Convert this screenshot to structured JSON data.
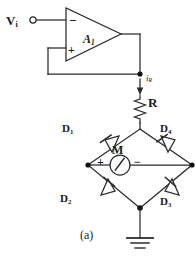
{
  "figure": {
    "caption": "(a)"
  },
  "labels": {
    "input_source": "V",
    "input_source_sub": "i",
    "opamp": "A",
    "opamp_sub": "1",
    "inverting_input": "−",
    "noninverting_input": "+",
    "resistor_current": "i",
    "resistor_current_sub": "R",
    "resistor": "R",
    "diode_1": "D",
    "diode_1_sub": "1",
    "diode_2": "D",
    "diode_2_sub": "2",
    "diode_3": "D",
    "diode_3_sub": "3",
    "diode_4": "D",
    "diode_4_sub": "4",
    "meter": "M",
    "meter_plus": "+",
    "meter_minus": "−"
  },
  "colors": {
    "wire": "#2b2b2b",
    "text": "#1a1a1a",
    "background": "#ffffff",
    "node": "#111111"
  },
  "components": [
    {
      "name": "input-terminal",
      "type": "terminal",
      "label": "Vi"
    },
    {
      "name": "opamp",
      "type": "operational-amplifier",
      "label": "A1"
    },
    {
      "name": "feedback-wire",
      "type": "wire"
    },
    {
      "name": "resistor",
      "type": "resistor",
      "label": "R"
    },
    {
      "name": "current-arrow",
      "type": "current-direction",
      "label": "iR"
    },
    {
      "name": "diode-1",
      "type": "diode",
      "label": "D1"
    },
    {
      "name": "diode-2",
      "type": "diode",
      "label": "D2"
    },
    {
      "name": "diode-3",
      "type": "diode",
      "label": "D3"
    },
    {
      "name": "diode-4",
      "type": "diode",
      "label": "D4"
    },
    {
      "name": "meter",
      "type": "moving-coil-meter",
      "label": "M"
    },
    {
      "name": "ground",
      "type": "ground-symbol"
    }
  ]
}
